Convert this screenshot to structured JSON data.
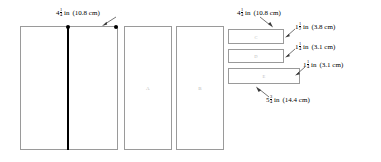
{
  "diagram": {
    "rectangles": [
      {
        "id": "big",
        "label": ""
      },
      {
        "id": "A",
        "label": "A"
      },
      {
        "id": "B",
        "label": "B"
      },
      {
        "id": "C",
        "label": "C"
      },
      {
        "id": "D",
        "label": "D"
      },
      {
        "id": "E",
        "label": "E"
      }
    ],
    "measurements": [
      {
        "id": "m1",
        "whole": "4",
        "num": "1",
        "den": "4",
        "unit": "in",
        "metric": "(10.8 cm)"
      },
      {
        "id": "m2",
        "whole": "4",
        "num": "1",
        "den": "4",
        "unit": "in",
        "metric": "(10.8 cm)"
      },
      {
        "id": "m3",
        "whole": "1",
        "num": "1",
        "den": "2",
        "unit": "in",
        "metric": "(3.8 cm)"
      },
      {
        "id": "m4",
        "whole": "1",
        "num": "1",
        "den": "4",
        "unit": "in",
        "metric": "(3.1 cm)"
      },
      {
        "id": "m5",
        "whole": "1",
        "num": "1",
        "den": "4",
        "unit": "in",
        "metric": "(3.1 cm)"
      },
      {
        "id": "m6",
        "whole": "5",
        "num": "3",
        "den": "4",
        "unit": "in",
        "metric": "(14.4 cm)"
      }
    ],
    "colors": {
      "stroke": "#9a9a9a",
      "marker": "#000000",
      "leader": "#3a3a3a",
      "background": "#ffffff"
    }
  }
}
